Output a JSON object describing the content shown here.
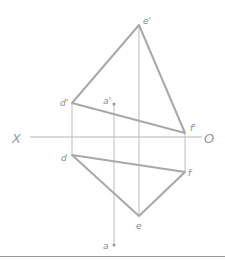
{
  "diagram": {
    "type": "orthographic projection",
    "axis": {
      "left_label": "X",
      "right_label": "O",
      "y": 137,
      "x1": 30,
      "x2": 202
    },
    "colors": {
      "edge": "#a8a8a8",
      "thin": "#bdbdbd",
      "label": "#888888"
    },
    "front_view": {
      "points": [
        {
          "id": "e1",
          "label": "e'",
          "x": 139,
          "y": 25
        },
        {
          "id": "d1",
          "label": "d'",
          "x": 72,
          "y": 103
        },
        {
          "id": "f1",
          "label": "f'",
          "x": 185,
          "y": 133
        },
        {
          "id": "a1",
          "label": "a'",
          "x": 114,
          "y": 104
        }
      ]
    },
    "top_view": {
      "points": [
        {
          "id": "d",
          "label": "d",
          "x": 72,
          "y": 155
        },
        {
          "id": "f",
          "label": "f",
          "x": 185,
          "y": 172
        },
        {
          "id": "e",
          "label": "e",
          "x": 139,
          "y": 216
        },
        {
          "id": "a",
          "label": "a",
          "x": 114,
          "y": 245
        }
      ]
    }
  }
}
